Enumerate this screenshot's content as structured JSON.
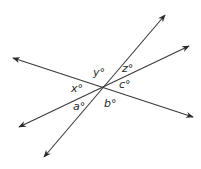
{
  "diagram": {
    "type": "intersecting-lines",
    "background": "#ffffff",
    "line_color": "#3a3a3a",
    "intersection": {
      "x": 104,
      "y": 87
    },
    "lines": [
      {
        "name": "line-steep",
        "from": {
          "x": 44,
          "y": 157
        },
        "to": {
          "x": 165,
          "y": 15
        }
      },
      {
        "name": "line-shallow-up",
        "from": {
          "x": 19,
          "y": 127
        },
        "to": {
          "x": 189,
          "y": 46
        }
      },
      {
        "name": "line-shallow-down",
        "from": {
          "x": 13,
          "y": 58
        },
        "to": {
          "x": 193,
          "y": 117
        }
      }
    ],
    "labels": {
      "y": {
        "text": "y°",
        "x": 93,
        "y": 76
      },
      "z": {
        "text": "z°",
        "x": 122,
        "y": 72
      },
      "x": {
        "text": "x°",
        "x": 71,
        "y": 92
      },
      "c": {
        "text": "c°",
        "x": 119,
        "y": 88
      },
      "a": {
        "text": "a°",
        "x": 73,
        "y": 110
      },
      "b": {
        "text": "b°",
        "x": 104,
        "y": 107
      }
    }
  }
}
